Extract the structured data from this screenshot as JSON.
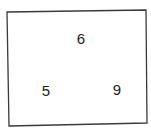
{
  "diagram": {
    "shape": "quadrilateral",
    "stroke_color": "#3a3a3a",
    "corners": {
      "top_left": [
        7,
        12
      ],
      "top_right": [
        146,
        10
      ],
      "bottom_right": [
        147,
        123
      ],
      "bottom_left": [
        9,
        126
      ]
    },
    "labels": [
      {
        "id": "top",
        "text": "6",
        "x": 81,
        "y": 38
      },
      {
        "id": "bottom-left",
        "text": "5",
        "x": 46,
        "y": 90
      },
      {
        "id": "bottom-right",
        "text": "9",
        "x": 117,
        "y": 89
      }
    ]
  }
}
